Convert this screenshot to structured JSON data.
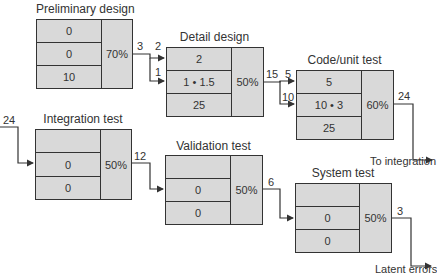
{
  "diagram": {
    "type": "defect-amplification-model",
    "stages": [
      {
        "id": "preliminary",
        "title": "Preliminary design",
        "rows": [
          "0",
          "0",
          "10"
        ],
        "efficiency": "70%"
      },
      {
        "id": "detail",
        "title": "Detail design",
        "rows": [
          "2",
          "1 • 1.5",
          "25"
        ],
        "efficiency": "50%"
      },
      {
        "id": "code",
        "title": "Code/unit test",
        "rows": [
          "5",
          "10 • 3",
          "25"
        ],
        "efficiency": "60%"
      },
      {
        "id": "integration",
        "title": "Integration test",
        "rows": [
          "",
          "0",
          "0"
        ],
        "efficiency": "50%"
      },
      {
        "id": "validation",
        "title": "Validation test",
        "rows": [
          "",
          "0",
          "0"
        ],
        "efficiency": "50%"
      },
      {
        "id": "system",
        "title": "System test",
        "rows": [
          "",
          "0",
          "0"
        ],
        "efficiency": "50%"
      }
    ],
    "flows": {
      "preliminary_out": "3",
      "detail_in_passed": "2",
      "detail_in_amplified": "1",
      "detail_out": "15",
      "code_in_passed": "5",
      "code_in_amplified": "10",
      "code_out": "24",
      "integration_in": "24",
      "integration_out": "12",
      "validation_out": "6",
      "system_out": "3"
    },
    "outputs": {
      "code_destination": "To integration",
      "final_destination": "Latent errors"
    }
  }
}
